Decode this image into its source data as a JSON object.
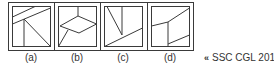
{
  "figures": [
    {
      "label": "(a)"
    },
    {
      "label": "(b)"
    },
    {
      "label": "(c)"
    },
    {
      "label": "(d)"
    }
  ],
  "source": {
    "arrow": "«",
    "text": "SSC CGL 2014"
  },
  "colors": {
    "line": "#3a3a3a",
    "text": "#333333"
  }
}
